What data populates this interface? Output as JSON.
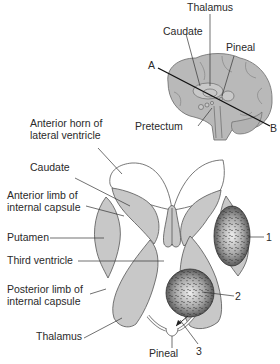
{
  "figure": {
    "type": "anatomical-diagram",
    "inset": {
      "view": "sagittal brain with section plane A-B",
      "labels": {
        "thalamus": "Thalamus",
        "caudate": "Caudate",
        "pineal": "Pineal",
        "pretectum": "Pretectum",
        "plane_start": "A",
        "plane_end": "B"
      }
    },
    "section": {
      "view": "horizontal section through basal ganglia",
      "left_labels": {
        "anterior_horn_line1": "Anterior horn of",
        "anterior_horn_line2": "lateral ventricle",
        "caudate": "Caudate",
        "anterior_limb_line1": "Anterior limb of",
        "anterior_limb_line2": "internal capsule",
        "putamen": "Putamen",
        "third_ventricle": "Third ventricle",
        "posterior_limb_line1": "Posterior limb of",
        "posterior_limb_line2": "internal capsule",
        "thalamus": "Thalamus"
      },
      "bottom_labels": {
        "pineal": "Pineal"
      },
      "lesion_markers": {
        "lesion1": "1",
        "lesion2": "2",
        "lesion3": "3"
      }
    },
    "colors": {
      "structure_fill": "#c8c8c8",
      "brain_fill": "#b9b9b9",
      "outline": "#555555",
      "leader": "#333333",
      "lesion_dark": "#4a4a4a",
      "lesion_light": "#e6e6e6"
    }
  }
}
